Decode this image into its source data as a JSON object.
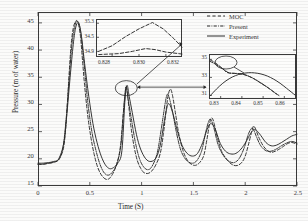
{
  "chart_data": {
    "type": "line",
    "title": "",
    "xlabel": "Time (S)",
    "ylabel": "Pressure (m of water)",
    "xlim": [
      0,
      2.5
    ],
    "ylim": [
      15,
      47
    ],
    "xticks": [
      "0",
      "0.5",
      "1",
      "1.5",
      "2",
      "2.5"
    ],
    "xtick_values": [
      0,
      0.5,
      1,
      1.5,
      2,
      2.5
    ],
    "yticks": [
      "15",
      "20",
      "25",
      "30",
      "35",
      "40",
      "45"
    ],
    "ytick_values": [
      15,
      20,
      25,
      30,
      35,
      40,
      45
    ],
    "grid": false,
    "legend_position": "top-right",
    "series": [
      {
        "name": "MOC",
        "style": "dashed",
        "color": "#2b2b2b",
        "x": [
          0,
          0.04,
          0.08,
          0.12,
          0.16,
          0.2,
          0.24,
          0.26,
          0.28,
          0.3,
          0.32,
          0.34,
          0.36,
          0.375,
          0.39,
          0.41,
          0.43,
          0.45,
          0.48,
          0.51,
          0.54,
          0.57,
          0.6,
          0.63,
          0.66,
          0.69,
          0.72,
          0.75,
          0.78,
          0.8,
          0.82,
          0.84,
          0.85,
          0.86,
          0.88,
          0.9,
          0.93,
          0.96,
          0.99,
          1.02,
          1.06,
          1.1,
          1.14,
          1.18,
          1.21,
          1.24,
          1.26,
          1.28,
          1.3,
          1.33,
          1.36,
          1.4,
          1.44,
          1.48,
          1.52,
          1.56,
          1.6,
          1.63,
          1.66,
          1.68,
          1.7,
          1.73,
          1.77,
          1.81,
          1.85,
          1.89,
          1.93,
          1.97,
          2.0,
          2.03,
          2.06,
          2.08,
          2.1,
          2.13,
          2.17,
          2.21,
          2.25,
          2.29,
          2.33,
          2.37,
          2.41,
          2.45,
          2.5
        ],
        "y": [
          19.0,
          19.0,
          19.1,
          19.2,
          19.4,
          19.8,
          21.5,
          24.0,
          29.0,
          35.5,
          41.0,
          44.0,
          45.2,
          45.4,
          44.8,
          42.5,
          38.0,
          33.5,
          28.0,
          24.0,
          21.0,
          18.8,
          17.4,
          16.6,
          16.2,
          16.4,
          17.2,
          18.5,
          20.5,
          23.0,
          27.5,
          31.5,
          33.4,
          32.5,
          29.0,
          25.5,
          22.0,
          19.6,
          18.3,
          17.5,
          17.3,
          17.8,
          19.0,
          21.0,
          24.5,
          29.5,
          32.0,
          32.8,
          31.5,
          28.0,
          24.5,
          21.5,
          19.8,
          19.0,
          18.8,
          19.3,
          20.6,
          23.5,
          26.8,
          27.5,
          26.5,
          24.0,
          21.5,
          20.2,
          19.3,
          18.8,
          18.8,
          19.4,
          20.5,
          22.5,
          24.8,
          26.0,
          25.5,
          24.0,
          22.5,
          21.6,
          21.2,
          21.4,
          21.8,
          22.3,
          22.8,
          23.0,
          22.7
        ]
      },
      {
        "name": "Present",
        "style": "dashdot",
        "color": "#2b2b2b",
        "x": [
          0,
          0.05,
          0.1,
          0.15,
          0.2,
          0.24,
          0.27,
          0.3,
          0.33,
          0.36,
          0.38,
          0.4,
          0.42,
          0.45,
          0.48,
          0.52,
          0.56,
          0.6,
          0.64,
          0.68,
          0.72,
          0.76,
          0.8,
          0.83,
          0.85,
          0.87,
          0.9,
          0.94,
          0.98,
          1.02,
          1.06,
          1.1,
          1.15,
          1.19,
          1.23,
          1.25,
          1.27,
          1.3,
          1.34,
          1.38,
          1.43,
          1.48,
          1.53,
          1.58,
          1.62,
          1.65,
          1.67,
          1.7,
          1.74,
          1.79,
          1.84,
          1.89,
          1.94,
          1.99,
          2.03,
          2.06,
          2.08,
          2.11,
          2.15,
          2.2,
          2.25,
          2.3,
          2.35,
          2.4,
          2.45,
          2.5
        ],
        "y": [
          19.0,
          19.0,
          19.2,
          19.4,
          19.9,
          22.0,
          27.0,
          34.5,
          41.5,
          44.8,
          45.3,
          44.6,
          42.0,
          36.5,
          30.5,
          25.0,
          21.5,
          18.9,
          17.4,
          17.0,
          17.6,
          19.0,
          22.5,
          30.0,
          33.2,
          31.0,
          27.5,
          23.0,
          20.0,
          18.5,
          18.0,
          18.6,
          21.0,
          25.5,
          30.5,
          31.9,
          31.0,
          28.5,
          24.5,
          21.5,
          19.8,
          19.2,
          19.6,
          21.5,
          25.0,
          27.0,
          27.2,
          25.5,
          22.5,
          20.6,
          19.6,
          19.3,
          20.0,
          22.0,
          24.5,
          25.6,
          25.4,
          24.0,
          22.4,
          21.5,
          21.4,
          21.8,
          22.4,
          22.9,
          23.2,
          22.9
        ]
      },
      {
        "name": "Experiment",
        "style": "solid",
        "color": "#2b2b2b",
        "x": [
          0,
          0.05,
          0.1,
          0.15,
          0.2,
          0.25,
          0.28,
          0.31,
          0.34,
          0.36,
          0.38,
          0.4,
          0.42,
          0.45,
          0.49,
          0.53,
          0.57,
          0.61,
          0.65,
          0.69,
          0.73,
          0.77,
          0.81,
          0.84,
          0.86,
          0.88,
          0.91,
          0.95,
          0.99,
          1.04,
          1.09,
          1.14,
          1.18,
          1.22,
          1.25,
          1.27,
          1.3,
          1.34,
          1.39,
          1.44,
          1.49,
          1.54,
          1.59,
          1.63,
          1.66,
          1.69,
          1.72,
          1.76,
          1.81,
          1.86,
          1.91,
          1.96,
          2.01,
          2.05,
          2.08,
          2.11,
          2.15,
          2.2,
          2.25,
          2.3,
          2.35,
          2.4,
          2.45,
          2.5
        ],
        "y": [
          19.2,
          19.2,
          19.3,
          19.5,
          20.0,
          23.0,
          28.5,
          35.0,
          41.0,
          43.8,
          45.0,
          44.5,
          42.5,
          37.5,
          31.5,
          26.5,
          23.0,
          20.5,
          18.9,
          18.2,
          18.4,
          19.2,
          21.5,
          31.0,
          33.5,
          31.5,
          28.5,
          24.5,
          21.8,
          20.0,
          19.5,
          20.2,
          22.5,
          27.0,
          29.8,
          30.0,
          28.5,
          25.5,
          22.5,
          21.0,
          20.5,
          21.0,
          23.0,
          25.3,
          26.4,
          26.2,
          25.0,
          22.8,
          21.4,
          20.9,
          21.0,
          21.8,
          23.2,
          24.6,
          25.3,
          25.2,
          24.3,
          23.0,
          22.4,
          22.5,
          23.0,
          23.6,
          24.2,
          24.5
        ]
      }
    ],
    "insets": [
      {
        "name": "inset-top",
        "xlim": [
          0.8268,
          0.8332
        ],
        "ylim": [
          34.82,
          35.36
        ],
        "xticks": [
          "0.828",
          "0.830",
          "0.832"
        ],
        "xtick_values": [
          0.828,
          0.83,
          0.832
        ],
        "yticks": [
          "35.3",
          "34.5",
          "34.9"
        ],
        "ytick_values": [
          35.3,
          35.1,
          34.9
        ],
        "series": [
          {
            "name": "MOC",
            "style": "dashed",
            "x": [
              0.827,
              0.828,
              0.829,
              0.83,
              0.831,
              0.8318,
              0.8326,
              0.8332
            ],
            "y": [
              34.9,
              34.98,
              35.11,
              35.22,
              35.31,
              35.22,
              35.08,
              34.96
            ]
          },
          {
            "name": "Present",
            "style": "dashed",
            "x": [
              0.827,
              0.8285,
              0.8295,
              0.8305,
              0.8312,
              0.832,
              0.8332
            ],
            "y": [
              34.855,
              34.868,
              34.9,
              34.94,
              34.925,
              34.89,
              34.862
            ]
          }
        ]
      },
      {
        "name": "inset-right",
        "xlim": [
          0.8245,
          0.8655
        ],
        "ylim": [
          30.6,
          35.6
        ],
        "xticks": [
          "0.83",
          "0.84",
          "0.85",
          "0.86"
        ],
        "xtick_values": [
          0.83,
          0.84,
          0.85,
          0.86
        ],
        "yticks": [
          "35",
          "33",
          "31"
        ],
        "ytick_values": [
          35,
          33,
          31
        ],
        "series": [
          {
            "name": "Experiment",
            "style": "solid",
            "x": [
              0.825,
              0.828,
              0.831,
              0.834,
              0.837,
              0.84,
              0.843,
              0.846,
              0.849,
              0.852,
              0.855,
              0.858,
              0.861,
              0.865
            ],
            "y": [
              30.95,
              31.7,
              32.35,
              32.85,
              33.2,
              33.42,
              33.52,
              33.5,
              33.38,
              33.15,
              32.8,
              32.35,
              31.8,
              31.05
            ]
          },
          {
            "name": "MOC",
            "style": "dashed",
            "x": [
              0.825,
              0.827,
              0.829,
              0.831,
              0.833,
              0.8355,
              0.838,
              0.8405,
              0.843,
              0.846,
              0.849,
              0.852,
              0.855,
              0.858
            ],
            "y": [
              34.95,
              34.7,
              34.35,
              33.95,
              33.55,
              33.45,
              33.42,
              33.35,
              33.15,
              32.8,
              32.35,
              31.9,
              31.4,
              30.9
            ]
          },
          {
            "name": "Present",
            "style": "dashdot",
            "x": [
              0.825,
              0.8272,
              0.8295,
              0.8318,
              0.834,
              0.8365,
              0.839,
              0.8415,
              0.8445,
              0.8475,
              0.8505,
              0.8535,
              0.8565
            ],
            "y": [
              34.78,
              34.52,
              34.18,
              33.82,
              33.5,
              33.46,
              33.4,
              33.28,
              33.0,
              32.6,
              32.15,
              31.65,
              31.1
            ]
          }
        ]
      }
    ],
    "annotations": [
      {
        "type": "ellipse-callout",
        "target_time": 0.85,
        "target_pressure": 33.4,
        "points_to": "inset-top"
      },
      {
        "type": "ellipse-callout",
        "target_time": 0.85,
        "target_pressure": 33.4,
        "points_to": "inset-right"
      },
      {
        "type": "ellipse-callout",
        "target_time": 0.83,
        "target_pressure": 35.0,
        "points_to": "inset-right-detail"
      }
    ]
  },
  "legend": {
    "items": [
      {
        "label": "MOC",
        "style": "dashed"
      },
      {
        "label": "Present",
        "style": "dashdot"
      },
      {
        "label": "Experiment",
        "style": "solid"
      }
    ]
  }
}
